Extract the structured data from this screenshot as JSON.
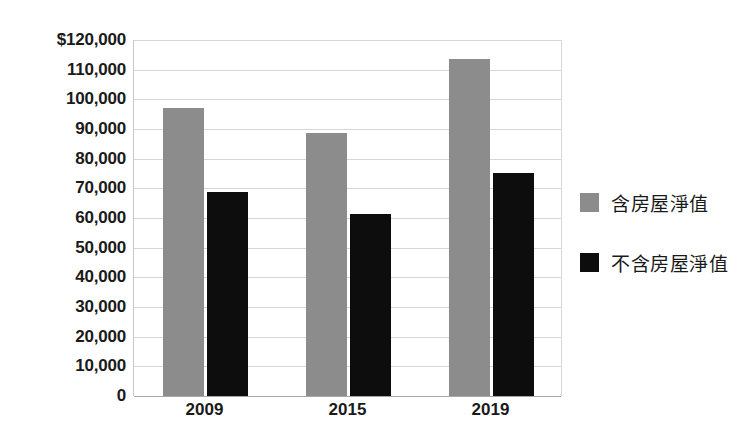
{
  "chart_data": {
    "type": "bar",
    "title": "",
    "subtitle": "",
    "xlabel": "",
    "ylabel": "",
    "categories": [
      "2009",
      "2015",
      "2019"
    ],
    "series": [
      {
        "name": "含房屋淨值",
        "color": "#8c8c8c",
        "values": [
          97000,
          88700,
          113500
        ]
      },
      {
        "name": "不含房屋淨值",
        "color": "#0d0d0d",
        "values": [
          68800,
          61500,
          75300
        ]
      }
    ],
    "ylim": [
      0,
      120000
    ],
    "ytick_values": [
      0,
      10000,
      20000,
      30000,
      40000,
      50000,
      60000,
      70000,
      80000,
      90000,
      100000,
      110000,
      120000
    ],
    "ytick_labels": [
      "0",
      "10,000",
      "20,000",
      "30,000",
      "40,000",
      "50,000",
      "60,000",
      "70,000",
      "80,000",
      "90,000",
      "100,000",
      "110,000",
      "$120,000"
    ],
    "grid": true,
    "legend_position": "right",
    "background_color": "#ffffff",
    "gridline_color": "#d6d6d6"
  },
  "legend": {
    "entries": [
      {
        "label": "含房屋淨值",
        "color": "#8c8c8c"
      },
      {
        "label": "不含房屋淨值",
        "color": "#0d0d0d"
      }
    ]
  }
}
